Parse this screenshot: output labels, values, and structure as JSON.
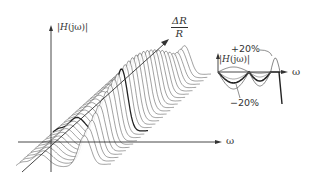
{
  "figure": {
    "type": "3d-waterfall-frequency-response",
    "main_axes": {
      "vertical_label_prefix": "|",
      "vertical_label_fn": "H",
      "vertical_label_arg": "(jω)|",
      "horizontal_label": "ω",
      "depth_label_numerator": "ΔR",
      "depth_label_denominator": "R"
    },
    "inset": {
      "vertical_label_prefix": "|",
      "vertical_label_fn": "H",
      "vertical_label_arg": "(jω)|",
      "horizontal_label": "ω",
      "annotation_upper": "+20%",
      "annotation_lower": "−20%"
    },
    "curves": {
      "count": 28,
      "highlighted_index": 10,
      "stroke_color": "#555555",
      "highlight_color": "#222222",
      "axis_color": "#333333"
    }
  }
}
